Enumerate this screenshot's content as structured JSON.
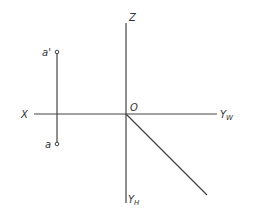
{
  "diagram": {
    "type": "orthographic-projection-axes",
    "axes": {
      "z_label": "Z",
      "x_label": "X",
      "origin_label": "O",
      "yw_label": "Y",
      "yw_sub": "W",
      "yh_label": "Y",
      "yh_sub": "H"
    },
    "points": [
      {
        "label": "a'",
        "x": 57,
        "y": 52
      },
      {
        "label": "a",
        "x": 57,
        "y": 144
      }
    ],
    "colors": {
      "line": "#444444",
      "text": "#333333",
      "background": "#ffffff"
    }
  }
}
